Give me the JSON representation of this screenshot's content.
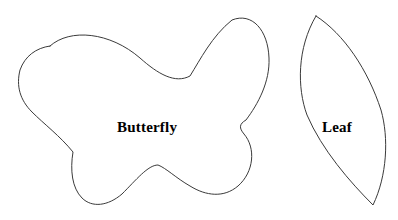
{
  "page": {
    "background_color": "#ffffff",
    "width": 398,
    "height": 220
  },
  "style": {
    "outline_color": "#3a3a3a",
    "fill_color": "#ffffff",
    "label_color": "#000000",
    "outline_width": 1
  },
  "shapes": [
    {
      "id": "butterfly",
      "label": "Butterfly",
      "label_position": {
        "x": 117,
        "y": 120
      },
      "bounds": {
        "x": 18,
        "y": 16,
        "width": 252,
        "height": 190
      },
      "outline_color": "#3a3a3a",
      "fill_color": "#ffffff",
      "path": "M 50 46 C 70 28, 110 32, 140 58 C 158 74, 175 84, 190 76 C 200 60, 212 36, 232 20 C 252 12, 268 30, 269 58 C 270 82, 258 104, 246 120 C 239 124, 239 128, 244 134 C 256 148, 254 172, 238 186 C 224 198, 206 196, 190 186 C 176 178, 166 168, 158 165 C 148 165, 136 180, 122 194 C 108 206, 92 208, 82 198 C 72 188, 70 170, 73 152 C 60 136, 44 124, 32 112 C 20 100, 16 86, 20 70 C 25 56, 36 48, 50 46 Z"
    },
    {
      "id": "leaf",
      "label": "Leaf",
      "label_position": {
        "x": 322,
        "y": 120
      },
      "bounds": {
        "x": 299,
        "y": 16,
        "width": 86,
        "height": 190
      },
      "outline_color": "#3a3a3a",
      "fill_color": "#ffffff",
      "path": "M 316 16 C 344 34, 368 70, 381 110 C 389 138, 387 176, 373 205 C 350 182, 322 150, 307 115 C 297 88, 297 48, 316 16 Z"
    }
  ]
}
